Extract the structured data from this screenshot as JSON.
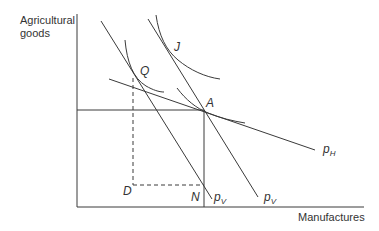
{
  "axes": {
    "y_label_line1": "Agricultural",
    "y_label_line2": "goods",
    "x_label": "Manufactures"
  },
  "points": {
    "J": "J",
    "Q": "Q",
    "A": "A",
    "D": "D",
    "N": "N"
  },
  "lines": {
    "pH": {
      "base": "p",
      "sub": "H"
    },
    "pV_left": {
      "base": "p",
      "sub": "V"
    },
    "pV_right": {
      "base": "p",
      "sub": "V"
    }
  },
  "colors": {
    "stroke": "#3a3a3a",
    "text": "#333333",
    "background": "#ffffff"
  }
}
